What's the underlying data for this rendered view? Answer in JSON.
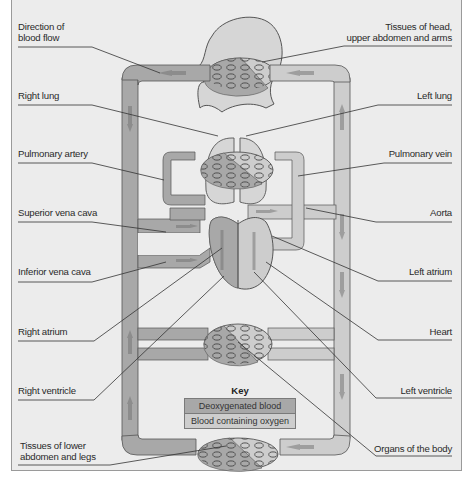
{
  "labels": {
    "direction_of_blood_flow": "Direction of\nblood flow",
    "right_lung": "Right lung",
    "pulmonary_artery": "Pulmonary artery",
    "superior_vena_cava": "Superior vena cava",
    "inferior_vena_cava": "Inferior vena cava",
    "right_atrium": "Right atrium",
    "right_ventricle": "Right ventricle",
    "tissues_lower": "Tissues of lower\nabdomen and legs",
    "tissues_head": "Tissues of head,\nupper abdomen and arms",
    "left_lung": "Left lung",
    "pulmonary_vein": "Pulmonary vein",
    "aorta": "Aorta",
    "left_atrium": "Left atrium",
    "heart": "Heart",
    "left_ventricle": "Left ventricle",
    "organs_of_the_body": "Organs of the body"
  },
  "key": {
    "title": "Key",
    "items": [
      {
        "label": "Deoxygenated blood",
        "color": "#a8a8a8"
      },
      {
        "label": "Blood containing oxygen",
        "color": "#cdcdcd"
      }
    ]
  },
  "colors": {
    "background": "#ececec",
    "deoxygenated": "#a8a8a8",
    "oxygenated": "#cdcdcd",
    "arrow_deoxy": "#8c8c8c",
    "arrow_oxy": "#9e9e9e",
    "outline": "#555555",
    "leader_line": "#333333"
  }
}
